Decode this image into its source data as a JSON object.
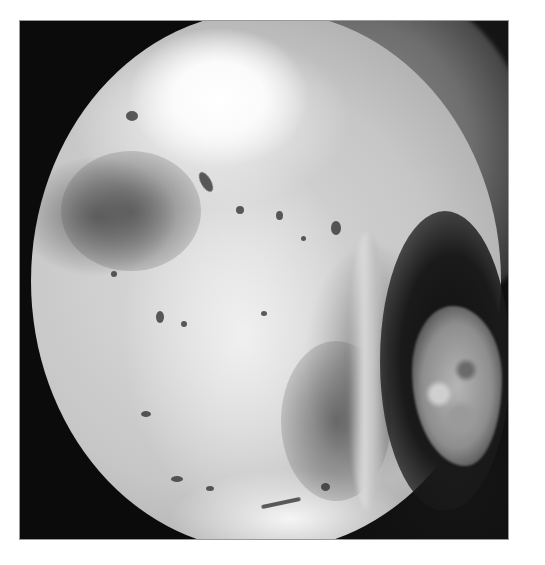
{
  "image": {
    "kind": "grayscale endoscopic view",
    "frame": {
      "x": 20,
      "y": 21,
      "width": 488,
      "height": 518,
      "background": "#0b0b0b",
      "border": "#9a9a9a"
    },
    "page_background": "#ffffff",
    "regions": [
      {
        "name": "circular-field-of-view",
        "shape": "ellipse",
        "approx_bounds": [
          31,
          11,
          501,
          551
        ],
        "tone": "light grey to white"
      },
      {
        "name": "bright-highlight",
        "approx_bounds": [
          130,
          40,
          320,
          200
        ],
        "tone": "#ffffff"
      },
      {
        "name": "upper-right-band",
        "approx_bounds": [
          310,
          21,
          500,
          290
        ],
        "tone": "#7a7a7a"
      },
      {
        "name": "dark-crescent",
        "approx_bounds": [
          380,
          210,
          440,
          480
        ],
        "tone": "#151515"
      },
      {
        "name": "right-fragment",
        "approx_bounds": [
          410,
          300,
          500,
          460
        ],
        "tone": "#a0a0a0"
      }
    ]
  }
}
